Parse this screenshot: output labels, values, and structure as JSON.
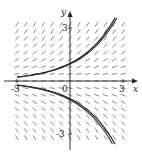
{
  "figure": {
    "type": "slope-field",
    "equation_hint": "dy/dx = y/2",
    "axes": {
      "x_label": "x",
      "y_label": "y",
      "x_ticks": [
        {
          "value": -3,
          "label": "-3"
        },
        {
          "value": 0,
          "label": "0"
        },
        {
          "value": 3,
          "label": "3"
        }
      ],
      "y_ticks": [
        {
          "value": 3,
          "label": "3"
        },
        {
          "value": -3,
          "label": "-3"
        }
      ],
      "origin_label": "0",
      "xlim": [
        -3.4,
        3.8
      ],
      "ylim": [
        -4.3,
        3.8
      ]
    },
    "field": {
      "x_range": [
        -3,
        3
      ],
      "y_range": [
        -3.2,
        3.2
      ],
      "x_step": 0.5,
      "y_step": 0.4,
      "k": 0.5,
      "color": "#555555"
    },
    "solution_curves": [
      {
        "name": "upper",
        "formula": "y = e^(x/2)",
        "C": 1.0,
        "color": "#111111"
      },
      {
        "name": "upper-companion",
        "formula": "y = 0.95 e^(x/2)",
        "C": 0.95,
        "color": "#333333"
      },
      {
        "name": "lower",
        "formula": "y = -e^(x/2)",
        "C": -1.0,
        "color": "#111111"
      },
      {
        "name": "lower-companion",
        "formula": "y = -1.07 e^(x/2)",
        "C": -1.07,
        "color": "#333333"
      }
    ],
    "colors": {
      "axis": "#222222",
      "background": "#ffffff"
    }
  }
}
